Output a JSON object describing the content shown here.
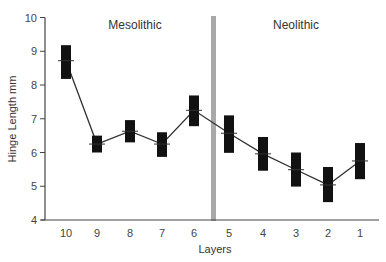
{
  "chart_data": {
    "type": "line",
    "title": "",
    "xlabel": "Layers",
    "ylabel": "Hinge Length mm",
    "ylim": [
      4,
      10
    ],
    "yticks": [
      4,
      5,
      6,
      7,
      8,
      9,
      10
    ],
    "grid": false,
    "legend": null,
    "categories": [
      "10",
      "9",
      "8",
      "7",
      "6",
      "5",
      "4",
      "3",
      "2",
      "1"
    ],
    "series": [
      {
        "name": "Mean hinge length",
        "values": [
          8.72,
          6.25,
          6.63,
          6.25,
          7.25,
          6.57,
          5.96,
          5.49,
          5.04,
          5.75
        ],
        "range_high": [
          9.18,
          6.5,
          6.96,
          6.6,
          7.69,
          7.1,
          6.46,
          6.0,
          5.57,
          6.28
        ],
        "range_low": [
          8.18,
          6.0,
          6.3,
          5.87,
          6.78,
          5.99,
          5.46,
          4.99,
          4.53,
          5.21
        ]
      }
    ],
    "annotations": [
      {
        "text": "Mesolithic",
        "region": "layers 10-6"
      },
      {
        "text": "Neolithic",
        "region": "layers 5-1"
      },
      {
        "type": "vertical-divider",
        "between": [
          "6",
          "5"
        ],
        "color": "#aaaaaa"
      }
    ]
  },
  "labels": {
    "mesolithic": "Mesolithic",
    "neolithic": "Neolithic",
    "xlabel": "Layers",
    "ylabel": "Hinge Length mm"
  },
  "colors": {
    "box": "#111111",
    "line": "#333333",
    "divider": "#a9a9a9",
    "axis": "#444444"
  }
}
